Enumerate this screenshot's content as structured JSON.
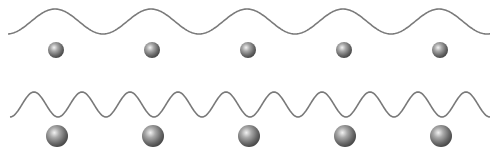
{
  "diagram": {
    "background": "#ffffff",
    "wave_color": "#7a7a7a",
    "rows": [
      {
        "name": "low-frequency",
        "wave": {
          "x_start": 8,
          "x_end": 490,
          "baseline_y": 21.5,
          "amplitude": 12.5,
          "period": 96,
          "phase_peak_x": 55
        },
        "ball": {
          "diameter": 16,
          "center_y": 50,
          "centers_x": [
            56,
            152,
            248,
            344,
            440
          ]
        }
      },
      {
        "name": "high-frequency",
        "wave": {
          "x_start": 10,
          "x_end": 490,
          "baseline_y": 104.5,
          "amplitude": 12.5,
          "period": 48,
          "phase_peak_x": 34
        },
        "ball": {
          "diameter": 22,
          "center_y": 136,
          "centers_x": [
            57,
            153,
            249,
            345,
            441
          ]
        }
      }
    ]
  }
}
